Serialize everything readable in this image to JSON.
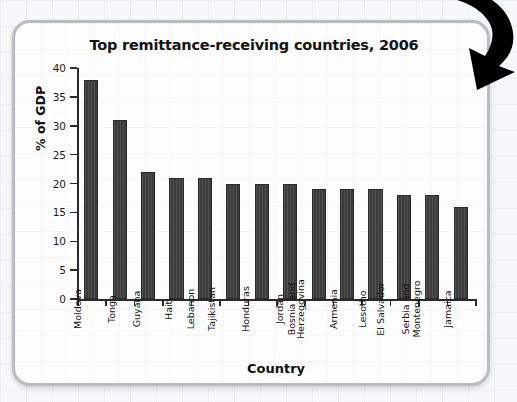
{
  "chart_data": {
    "type": "bar",
    "title": "Top remittance-receiving countries, 2006",
    "xlabel": "Country",
    "ylabel": "% of GDP",
    "ylim": [
      0,
      40
    ],
    "yticks": [
      0,
      5,
      10,
      15,
      20,
      25,
      30,
      35,
      40
    ],
    "ytick_labels": [
      "0",
      "5",
      "10",
      "15",
      "20",
      "25",
      "30",
      "35",
      "40"
    ],
    "grid": false,
    "legend": "none",
    "orientation": "vertical",
    "bar_color": "#3d3d3d",
    "categories": [
      "Moldova",
      "Tonga",
      "Guyana",
      "Haiti",
      "Lebanon",
      "Tajikistan",
      "Honduras",
      "Jordan",
      "Bosnia and Herzegovina",
      "Armenia",
      "Lesotho",
      "El Salvador",
      "Serbia and Montenegro",
      "Jamaica"
    ],
    "category_label_lines": [
      [
        "Moldova"
      ],
      [
        "Tonga"
      ],
      [
        "Guyana"
      ],
      [
        "Haiti"
      ],
      [
        "Lebanon"
      ],
      [
        "Tajikistan"
      ],
      [
        "Honduras"
      ],
      [
        "Jordan"
      ],
      [
        "Bosnia and",
        "Herzegovina"
      ],
      [
        "Armenia"
      ],
      [
        "Lesotho"
      ],
      [
        "El Salvador"
      ],
      [
        "Serbia and",
        "Montenegro"
      ],
      [
        "Jamaica"
      ]
    ],
    "values": [
      38,
      31,
      22,
      21,
      21,
      20,
      20,
      20,
      19,
      19,
      19,
      18,
      18,
      16
    ]
  },
  "decoration": {
    "arrow_icon": "curved-arrow-down-right",
    "arrow_color": "#000000"
  },
  "panel": {
    "border_color": "#b9bcc0",
    "background_color": "#fdfdfd"
  }
}
